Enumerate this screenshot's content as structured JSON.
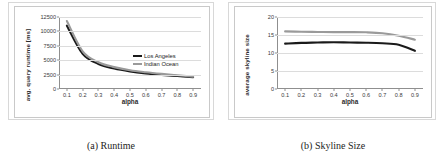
{
  "figures": [
    {
      "id": "runtime",
      "caption": "(a) Runtime",
      "chart_data": {
        "type": "line",
        "title": "",
        "xlabel": "alpha",
        "ylabel": "avg. query runtime [ms]",
        "x": [
          0.1,
          0.2,
          0.3,
          0.4,
          0.5,
          0.6,
          0.7,
          0.8,
          0.9
        ],
        "xticks": [
          "0.1",
          "0.2",
          "0.3",
          "0.4",
          "0.5",
          "0.6",
          "0.7",
          "0.8",
          "0.9"
        ],
        "yticks": [
          "0",
          "2500",
          "5000",
          "7500",
          "10000",
          "12500"
        ],
        "ytickvals": [
          0,
          2500,
          5000,
          7500,
          10000,
          12500
        ],
        "xlim": [
          0.05,
          0.95
        ],
        "ylim": [
          0,
          12500
        ],
        "grid": "horizontal",
        "legend_position": "inside-right",
        "series": [
          {
            "name": "Los Angeles",
            "color": "#1a1a1a",
            "width": 2.1,
            "values": [
              11000,
              6100,
              4350,
              3550,
              3050,
              2700,
              2450,
              2250,
              2050
            ]
          },
          {
            "name": "Indian Ocean",
            "color": "#9a9a9a",
            "width": 2.1,
            "values": [
              11800,
              6550,
              4650,
              3800,
              3250,
              2900,
              2620,
              2380,
              2150
            ]
          }
        ]
      }
    },
    {
      "id": "skyline-size",
      "caption": "(b) Skyline Size",
      "chart_data": {
        "type": "line",
        "title": "",
        "xlabel": "alpha",
        "ylabel": "average skyline size",
        "x": [
          0.1,
          0.2,
          0.3,
          0.4,
          0.5,
          0.6,
          0.7,
          0.8,
          0.9
        ],
        "xticks": [
          "0.1",
          "0.2",
          "0.3",
          "0.4",
          "0.5",
          "0.6",
          "0.7",
          "0.8",
          "0.9"
        ],
        "yticks": [
          "0",
          "5",
          "10",
          "15",
          "20"
        ],
        "ytickvals": [
          0,
          5,
          10,
          15,
          20
        ],
        "xlim": [
          0.05,
          0.95
        ],
        "ylim": [
          0,
          20
        ],
        "grid": "horizontal",
        "legend_position": "inside-right",
        "series": [
          {
            "name": "Los Angeles",
            "color": "#1a1a1a",
            "width": 2.1,
            "values": [
              12.6,
              12.8,
              12.9,
              13.0,
              12.9,
              12.85,
              12.7,
              12.3,
              10.6
            ]
          },
          {
            "name": "Indian Ocean",
            "color": "#9a9a9a",
            "width": 2.1,
            "values": [
              16.0,
              15.9,
              15.85,
              15.8,
              15.8,
              15.75,
              15.5,
              14.8,
              13.7
            ]
          }
        ]
      }
    }
  ]
}
